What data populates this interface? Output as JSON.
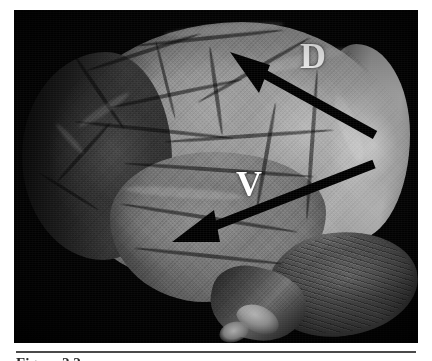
{
  "figure": {
    "domain": "scientific-figure",
    "caption": "Figure 2.2",
    "plate": {
      "background_color": "#020202",
      "description": "Lateral view photograph of a brain on a black background"
    },
    "annotations": [
      {
        "id": "dorsal",
        "label": "D",
        "meaning": "dorsal",
        "color": "#ffffff",
        "arrow_color": "#000000",
        "arrow_from": [
          361,
          125
        ],
        "arrow_to": [
          218,
          45
        ],
        "direction": "up-left"
      },
      {
        "id": "ventral",
        "label": "V",
        "meaning": "ventral",
        "color": "#ffffff",
        "arrow_color": "#000000",
        "arrow_from": [
          360,
          154
        ],
        "arrow_to": [
          161,
          227
        ],
        "direction": "down-left"
      }
    ],
    "anatomy": [
      {
        "name": "frontal-pole",
        "tone": "dark"
      },
      {
        "name": "cerebrum",
        "tone": "mid-gray"
      },
      {
        "name": "occipital-pole",
        "tone": "bright"
      },
      {
        "name": "temporal-lobe",
        "tone": "mid-gray"
      },
      {
        "name": "cerebellum",
        "tone": "dark-textured"
      },
      {
        "name": "brainstem",
        "tone": "dark-with-highlight"
      }
    ]
  }
}
